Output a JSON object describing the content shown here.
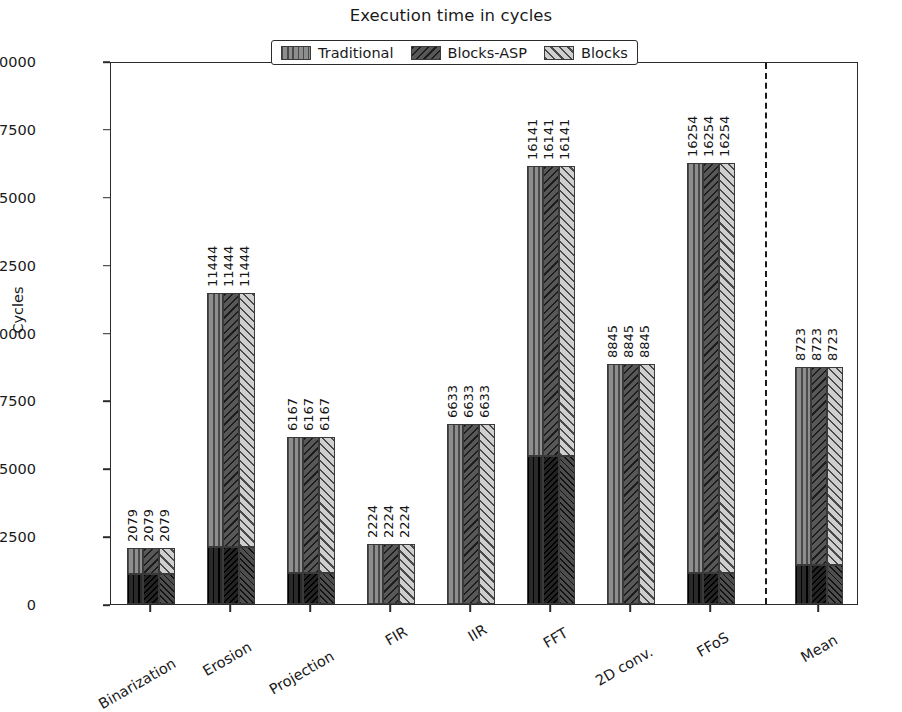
{
  "chart_data": {
    "type": "bar",
    "title": "Execution time in cycles",
    "xlabel": "",
    "ylabel": "Cycles",
    "ylim": [
      0,
      20000
    ],
    "yticks": [
      0,
      2500,
      5000,
      7500,
      10000,
      12500,
      15000,
      17500,
      20000
    ],
    "ytick_labels": [
      "0",
      "2500",
      "5000",
      "7500",
      "10000",
      "12500",
      "15000",
      "17500",
      "20000"
    ],
    "grid": false,
    "legend_position": "upper center",
    "stacked": true,
    "categories": [
      "Binarization",
      "Erosion",
      "Projection",
      "FIR",
      "IIR",
      "FFT",
      "2D conv.",
      "FFoS",
      "Mean"
    ],
    "series": [
      {
        "name": "Traditional",
        "pattern": "vertical-lines",
        "color": "#8e8e8e",
        "values": [
          2079,
          11444,
          6167,
          2224,
          6633,
          16141,
          8845,
          16254,
          8723
        ],
        "overhead": [
          1100,
          2110,
          1140,
          0,
          0,
          5450,
          0,
          1160,
          1420
        ]
      },
      {
        "name": "Blocks-ASP",
        "pattern": "dense-backslash",
        "color": "#585858",
        "values": [
          2079,
          11444,
          6167,
          2224,
          6633,
          16141,
          8845,
          16254,
          8723
        ],
        "overhead": [
          1100,
          2110,
          1140,
          0,
          0,
          5450,
          0,
          1160,
          1420
        ]
      },
      {
        "name": "Blocks",
        "pattern": "forward-slash",
        "color": "#cfcfcf",
        "values": [
          2079,
          11444,
          6167,
          2224,
          6633,
          16141,
          8845,
          16254,
          8723
        ],
        "overhead": [
          1100,
          2110,
          1140,
          0,
          0,
          5450,
          0,
          1160,
          1420
        ]
      }
    ],
    "value_labels": [
      [
        "2079",
        "2079",
        "2079"
      ],
      [
        "11444",
        "11444",
        "11444"
      ],
      [
        "6167",
        "6167",
        "6167"
      ],
      [
        "2224",
        "2224",
        "2224"
      ],
      [
        "6633",
        "6633",
        "6633"
      ],
      [
        "16141",
        "16141",
        "16141"
      ],
      [
        "8845",
        "8845",
        "8845"
      ],
      [
        "16254",
        "16254",
        "16254"
      ],
      [
        "8723",
        "8723",
        "8723"
      ]
    ],
    "annotations": [
      {
        "type": "vline",
        "style": "dashed",
        "after_category": "FFoS",
        "note": "separates benchmarks from Mean"
      }
    ]
  },
  "legend": {
    "items": [
      {
        "label": "Traditional"
      },
      {
        "label": "Blocks-ASP"
      },
      {
        "label": "Blocks"
      }
    ]
  }
}
